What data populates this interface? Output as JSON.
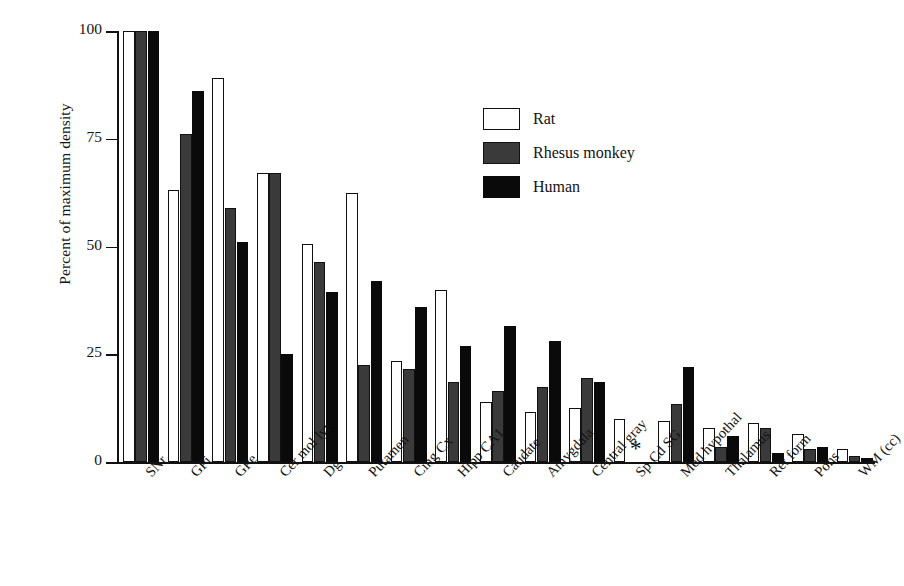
{
  "chart_data": {
    "type": "bar",
    "title": "",
    "xlabel": "",
    "ylabel": "Percent of maximum density",
    "ylim": [
      0,
      100
    ],
    "yticks": [
      0,
      25,
      50,
      75,
      100
    ],
    "ytick_labels": [
      "0",
      "25",
      "50",
      "75",
      "100"
    ],
    "grid": false,
    "legend_position": "upper-center-right",
    "categories": [
      "SNr",
      "GPi",
      "GPe",
      "Cer mol lyr",
      "Dg",
      "Putamen",
      "Cing Cx",
      "Hipp CA1",
      "Caudate",
      "Amygdala",
      "Central gray",
      "Sp Cd SG",
      "Med hypothal",
      "Thalamus",
      "Ret form",
      "Pons",
      "WM (cc)"
    ],
    "series": [
      {
        "name": "Rat",
        "color": "#ffffff",
        "values": [
          100,
          63,
          89,
          67,
          50.5,
          62.5,
          23.5,
          40,
          14,
          11.5,
          12.5,
          10,
          9.5,
          8,
          9,
          6.5,
          3
        ]
      },
      {
        "name": "Rhesus monkey",
        "color": "#3a3a3a",
        "values": [
          100,
          76,
          59,
          67,
          46.5,
          22.5,
          21.5,
          18.5,
          16.5,
          17.5,
          19.5,
          null,
          13.5,
          3.5,
          8,
          3,
          1.5
        ]
      },
      {
        "name": "Human",
        "color": "#0a0a0a",
        "values": [
          100,
          86,
          51,
          25,
          39.5,
          42,
          36,
          27,
          31.5,
          28,
          18.5,
          null,
          22,
          6,
          2,
          3.5,
          1
        ]
      }
    ],
    "annotations": [
      {
        "text": "*",
        "category": "Sp Cd SG",
        "meaning": "no-data-marker"
      }
    ]
  },
  "legend": {
    "entries": [
      {
        "label": "Rat",
        "swatch": "rat"
      },
      {
        "label": "Rhesus monkey",
        "swatch": "rhesus"
      },
      {
        "label": "Human",
        "swatch": "human"
      }
    ]
  }
}
